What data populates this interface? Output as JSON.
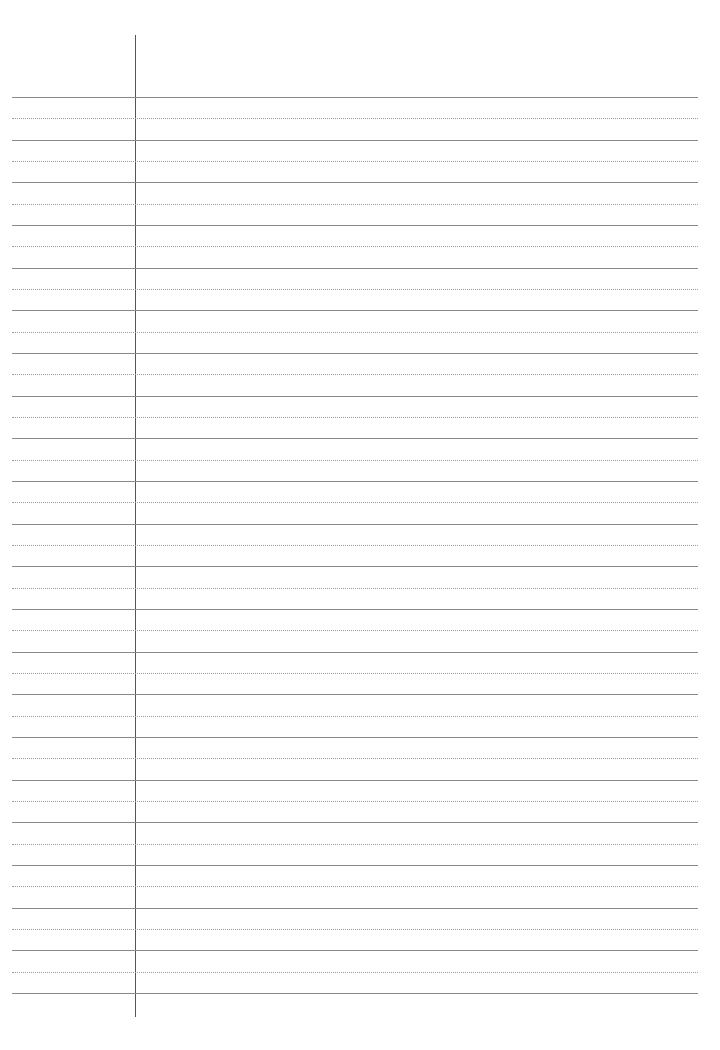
{
  "page": {
    "type": "lined-paper-template",
    "background": "#ffffff",
    "margin_line": {
      "x": 135,
      "top": 35,
      "bottom": 1017,
      "color": "#555555"
    },
    "rules": {
      "left": 12,
      "right": 698,
      "first_solid_y": 97,
      "spacing": 42.67,
      "solid_count": 22,
      "dotted_count": 21,
      "solid_color": "#8a8a8a",
      "dotted_color": "#9a9a9a"
    }
  }
}
